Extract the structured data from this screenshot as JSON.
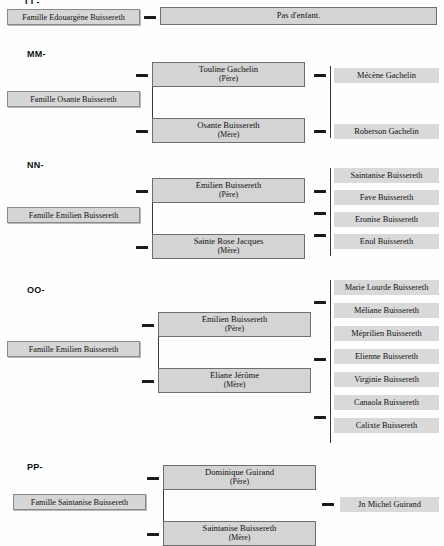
{
  "document": {
    "title": "Tableau généalogique — Familles Buissereth",
    "cropped_top_label": "LL-"
  },
  "sections": [
    {
      "id": "LL",
      "label": "",
      "family_label": "Famille Edouargène Buissereth",
      "note": "Pas d'enfant.",
      "parents": [],
      "children": []
    },
    {
      "id": "MM",
      "label": "MM-",
      "family_label": "Famille Osante Buissereth",
      "parents": [
        {
          "name": "Touline Gachelin",
          "role": "(Père)"
        },
        {
          "name": "Osante Buissereth",
          "role": "(Mère)"
        }
      ],
      "children": [
        "Mécène Gachelin",
        "Roberson Gachelin"
      ]
    },
    {
      "id": "NN",
      "label": "NN-",
      "family_label": "Famille Emilien Buissereth",
      "parents": [
        {
          "name": "Emilien Buissereth",
          "role": "(Père)"
        },
        {
          "name": "Sainte Rose Jacques",
          "role": "(Mère)"
        }
      ],
      "children": [
        "Saintanise Buissereth",
        "Fave Buissereth",
        "Eronise Buissereth",
        "Enol Buissereth"
      ]
    },
    {
      "id": "OO",
      "label": "OO-",
      "family_label": "Famille Emilien Buissereth",
      "parents": [
        {
          "name": "Emilien Buissereth",
          "role": "(Père)"
        },
        {
          "name": "Eliane Jérôme",
          "role": "(Mère)"
        }
      ],
      "children": [
        "Marie Lourde Buissereth",
        "Méliane Buissereth",
        "Méprilien Buissereth",
        "Elienne Buissereth",
        "Virginie Buissereth",
        "Canaola Buissereth",
        "Calixte Buissereth"
      ]
    },
    {
      "id": "PP",
      "label": "PP-",
      "family_label": "Famille Saintanise Buissereth",
      "parents": [
        {
          "name": "Dominique Guirand",
          "role": "(Père)"
        },
        {
          "name": "Saintanise Buissereth",
          "role": "(Mère)"
        }
      ],
      "children": [
        "Jn Michel Guirand"
      ]
    }
  ],
  "colors": {
    "box_fill": "#d4d4d4",
    "child_fill": "#d9d9d9",
    "box_border": "#6f6f6f",
    "connector": "#1b1b1b",
    "page_bg": "#fefefe"
  }
}
